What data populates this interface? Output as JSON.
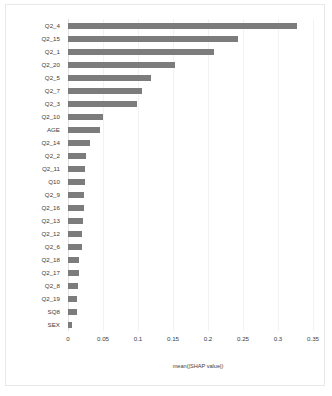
{
  "chart_data": {
    "type": "bar",
    "orientation": "horizontal",
    "title": "",
    "xlabel": "mean(|SHAP value|)",
    "ylabel": "",
    "xlim": [
      0,
      0.35
    ],
    "xticks": [
      "0",
      "0.05",
      "0.1",
      "0.15",
      "0.2",
      "0.25",
      "0.3",
      "0.35"
    ],
    "xtick_values": [
      0,
      0.05,
      0.1,
      0.15,
      0.2,
      0.25,
      0.3,
      0.35
    ],
    "grid": "vertical",
    "legend": "none",
    "bar_color": "#7c7c7c",
    "categories": [
      "Q2_4",
      "Q2_15",
      "Q2_1",
      "Q2_20",
      "Q2_5",
      "Q2_7",
      "Q2_3",
      "Q2_10",
      "AGE",
      "Q2_14",
      "Q2_2",
      "Q2_11",
      "Q10",
      "Q2_9",
      "Q2_16",
      "Q2_13",
      "Q2_12",
      "Q2_6",
      "Q2_18",
      "Q2_17",
      "Q2_8",
      "Q2_19",
      "SQ8",
      "SEX"
    ],
    "values": [
      0.327,
      0.243,
      0.208,
      0.153,
      0.118,
      0.105,
      0.099,
      0.05,
      0.046,
      0.031,
      0.026,
      0.024,
      0.024,
      0.023,
      0.023,
      0.021,
      0.02,
      0.02,
      0.016,
      0.015,
      0.014,
      0.013,
      0.013,
      0.005
    ]
  }
}
